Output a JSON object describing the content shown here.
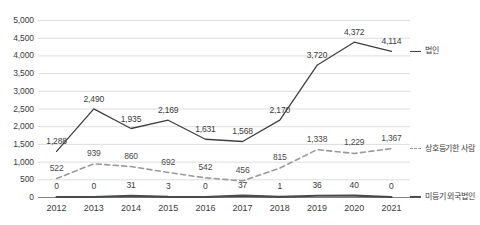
{
  "chart_data": {
    "type": "line",
    "title": "",
    "subtitle": "",
    "xlabel": "",
    "ylabel": "",
    "categories": [
      "2012",
      "2013",
      "2014",
      "2015",
      "2016",
      "2017",
      "2018",
      "2019",
      "2020",
      "2021"
    ],
    "ylim": [
      0,
      5000
    ],
    "ytick_labels": [
      "5,000",
      "4,500",
      "4,000",
      "3,500",
      "3,000",
      "2,500",
      "2,000",
      "1,500",
      "1,000",
      "500",
      "0"
    ],
    "ytick_values": [
      5000,
      4500,
      4000,
      3500,
      3000,
      2500,
      2000,
      1500,
      1000,
      500,
      0
    ],
    "grid": true,
    "legend_position": "right",
    "series": [
      {
        "name": "법인",
        "style": "solid",
        "color": "#404040",
        "values": [
          1288,
          2490,
          1935,
          2169,
          1631,
          1568,
          2170,
          3720,
          4372,
          4114
        ],
        "labels": [
          "1,288",
          "2,490",
          "1,935",
          "2,169",
          "1,631",
          "1,568",
          "2,170",
          "3,720",
          "4,372",
          "4,114"
        ]
      },
      {
        "name": "상호등기한 사람",
        "style": "dashed",
        "color": "#9a9a9a",
        "values": [
          522,
          939,
          860,
          692,
          542,
          456,
          815,
          1338,
          1229,
          1367
        ],
        "labels": [
          "522",
          "939",
          "860",
          "692",
          "542",
          "456",
          "815",
          "1,338",
          "1,229",
          "1,367"
        ]
      },
      {
        "name": "미등기 외국법인",
        "style": "solid-thick",
        "color": "#4a4a4a",
        "values": [
          0,
          0,
          31,
          3,
          0,
          37,
          1,
          36,
          40,
          0
        ],
        "labels": [
          "0",
          "0",
          "31",
          "3",
          "0",
          "37",
          "1",
          "36",
          "40",
          "0"
        ]
      }
    ]
  },
  "legend": {
    "items": [
      {
        "label": "법인"
      },
      {
        "label": "상호등기한 사람"
      },
      {
        "label": "미등기 외국법인"
      }
    ]
  }
}
